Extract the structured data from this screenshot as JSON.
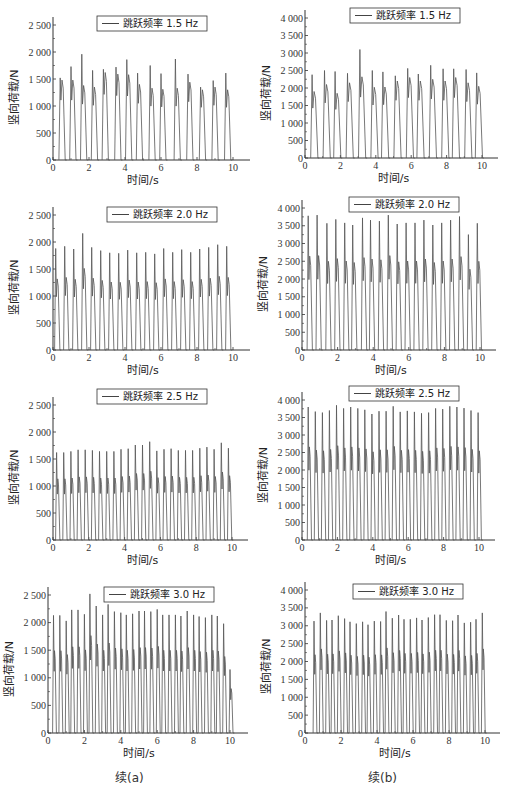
{
  "captions": {
    "left": "续(a)",
    "right": "续(b)"
  },
  "chart_data": [
    {
      "id": "a1",
      "type": "line",
      "legend": "跳跃频率 1.5 Hz",
      "xlabel": "时间/s",
      "ylabel": "竖向荷载/N",
      "xlim": [
        0,
        10
      ],
      "ylim": [
        0,
        2500
      ],
      "xticks": [
        0,
        2,
        4,
        6,
        8,
        10
      ],
      "yticks": [
        0,
        500,
        1000,
        1500,
        2000,
        2500
      ],
      "ytick_labels": [
        "0",
        "500",
        "1 000",
        "1 500",
        "2 000",
        "2 500"
      ],
      "peak_times": [
        0.4,
        1.0,
        1.6,
        2.2,
        2.8,
        3.5,
        4.1,
        4.7,
        5.4,
        6.0,
        6.8,
        7.5,
        8.2,
        8.9,
        9.6
      ],
      "peaks": [
        1520,
        1730,
        1960,
        1660,
        1680,
        1720,
        1860,
        1610,
        1750,
        1600,
        1870,
        1590,
        1350,
        1470,
        1610
      ],
      "shoulders": [
        1480,
        1480,
        1380,
        1350,
        1620,
        1590,
        1580,
        1400,
        1330,
        1310,
        1330,
        1440,
        1300,
        1350,
        1300
      ]
    },
    {
      "id": "b1",
      "type": "line",
      "legend": "跳跃频率 1.5 Hz",
      "xlabel": "时间/s",
      "ylabel": "竖向荷载/N",
      "xlim": [
        0,
        10
      ],
      "ylim": [
        0,
        4000
      ],
      "xticks": [
        0,
        2,
        4,
        6,
        8,
        10
      ],
      "yticks": [
        0,
        500,
        1000,
        1500,
        2000,
        2500,
        3000,
        3500,
        4000
      ],
      "ytick_labels": [
        "0",
        "500",
        "1 000",
        "1 500",
        "2 000",
        "2 500",
        "3 000",
        "3 500",
        "4 000"
      ],
      "peak_times": [
        0.4,
        1.1,
        1.7,
        2.4,
        3.1,
        3.8,
        4.4,
        5.1,
        5.8,
        6.4,
        7.1,
        7.8,
        8.4,
        9.1,
        9.7
      ],
      "peaks": [
        2380,
        2500,
        2470,
        2420,
        3100,
        2500,
        2460,
        2350,
        2560,
        2400,
        2650,
        2550,
        2550,
        2530,
        2430
      ],
      "shoulders": [
        1900,
        2100,
        1850,
        2150,
        2320,
        2020,
        2030,
        2200,
        2300,
        2200,
        2250,
        2200,
        2300,
        2150,
        2050
      ]
    },
    {
      "id": "a2",
      "type": "line",
      "legend": "跳跃频率 2.0 Hz",
      "xlabel": "时间/s",
      "ylabel": "竖向荷载/N",
      "xlim": [
        0,
        10
      ],
      "ylim": [
        0,
        2500
      ],
      "xticks": [
        0,
        2,
        4,
        6,
        8,
        10
      ],
      "yticks": [
        0,
        500,
        1000,
        1500,
        2000,
        2500
      ],
      "ytick_labels": [
        "0",
        "500",
        "1 000",
        "1 500",
        "2 000",
        "2 500"
      ],
      "peak_times": [
        0.15,
        0.65,
        1.15,
        1.65,
        2.15,
        2.65,
        3.15,
        3.65,
        4.15,
        4.65,
        5.15,
        5.65,
        6.15,
        6.65,
        7.15,
        7.65,
        8.15,
        8.65,
        9.15,
        9.65
      ],
      "peaks": [
        1880,
        1920,
        1870,
        2160,
        1900,
        1840,
        1800,
        1790,
        1850,
        1800,
        1810,
        1780,
        1880,
        1810,
        1860,
        1810,
        1870,
        1900,
        1950,
        1920
      ]
    },
    {
      "id": "b2",
      "type": "line",
      "legend": "跳跃频率 2.0 Hz",
      "xlabel": "时间/s",
      "ylabel": "竖向荷载/N",
      "xlim": [
        0,
        10
      ],
      "ylim": [
        0,
        4000
      ],
      "xticks": [
        0,
        2,
        4,
        6,
        8,
        10
      ],
      "yticks": [
        0,
        500,
        1000,
        1500,
        2000,
        2500,
        3000,
        3500,
        4000
      ],
      "ytick_labels": [
        "0",
        "500",
        "1 000",
        "1 500",
        "2 000",
        "2 500",
        "3 000",
        "3 500",
        "4 000"
      ],
      "peak_times": [
        0.35,
        0.85,
        1.4,
        1.9,
        2.4,
        2.85,
        3.4,
        3.85,
        4.35,
        4.85,
        5.35,
        5.85,
        6.35,
        6.85,
        7.35,
        7.85,
        8.35,
        8.85,
        9.35,
        9.85
      ],
      "peaks": [
        3780,
        3800,
        3570,
        3680,
        3580,
        3520,
        3720,
        3660,
        3630,
        3800,
        3550,
        3580,
        3580,
        3660,
        3520,
        3580,
        3660,
        3760,
        3250,
        3570
      ]
    },
    {
      "id": "a3",
      "type": "line",
      "legend": "跳跃频率 2.5 Hz",
      "xlabel": "时间/s",
      "ylabel": "竖向荷载/N",
      "xlim": [
        0,
        10
      ],
      "ylim": [
        0,
        2500
      ],
      "xticks": [
        0,
        2,
        4,
        6,
        8,
        10
      ],
      "yticks": [
        0,
        500,
        1000,
        1500,
        2000,
        2500
      ],
      "ytick_labels": [
        "0",
        "500",
        "1 000",
        "1 500",
        "2 000",
        "2 500"
      ],
      "peak_times": [
        0.2,
        0.6,
        1.0,
        1.4,
        1.8,
        2.2,
        2.6,
        3.0,
        3.4,
        3.8,
        4.2,
        4.6,
        5.0,
        5.4,
        5.8,
        6.2,
        6.6,
        7.0,
        7.4,
        7.8,
        8.2,
        8.6,
        9.0,
        9.4,
        9.8
      ],
      "peaks": [
        1620,
        1620,
        1640,
        1670,
        1670,
        1660,
        1640,
        1640,
        1640,
        1680,
        1690,
        1760,
        1760,
        1820,
        1650,
        1680,
        1690,
        1660,
        1660,
        1660,
        1700,
        1720,
        1680,
        1800,
        1700
      ]
    },
    {
      "id": "b3",
      "type": "line",
      "legend": "跳跃频率 2.5 Hz",
      "xlabel": "时间/s",
      "ylabel": "竖向荷载/N",
      "xlim": [
        0,
        10
      ],
      "ylim": [
        0,
        4000
      ],
      "xticks": [
        0,
        2,
        4,
        6,
        8,
        10
      ],
      "yticks": [
        0,
        500,
        1000,
        1500,
        2000,
        2500,
        3000,
        3500,
        4000
      ],
      "ytick_labels": [
        "0",
        "500",
        "1 000",
        "1 500",
        "2 000",
        "2 500",
        "3 000",
        "3 500",
        "4 000"
      ],
      "peak_times": [
        0.35,
        0.75,
        1.15,
        1.55,
        1.95,
        2.35,
        2.75,
        3.15,
        3.55,
        3.95,
        4.35,
        4.75,
        5.15,
        5.55,
        5.95,
        6.35,
        6.75,
        7.15,
        7.55,
        7.95,
        8.35,
        8.75,
        9.15,
        9.55,
        9.95
      ],
      "peaks": [
        3800,
        3670,
        3640,
        3700,
        3850,
        3760,
        3800,
        3760,
        3720,
        3600,
        3680,
        3680,
        3820,
        3660,
        3690,
        3660,
        3620,
        3640,
        3760,
        3740,
        3820,
        3800,
        3770,
        3700,
        3640
      ]
    },
    {
      "id": "a4",
      "type": "line",
      "legend": "跳跃频率 3.0 Hz",
      "xlabel": "时间/s",
      "ylabel": "竖向荷载/N",
      "xlim": [
        0,
        10
      ],
      "ylim": [
        0,
        2500
      ],
      "xticks": [
        0,
        2,
        4,
        6,
        8,
        10
      ],
      "yticks": [
        0,
        500,
        1000,
        1500,
        2000,
        2500
      ],
      "ytick_labels": [
        "0",
        "500",
        "1 000",
        "1 500",
        "2 000",
        "2 500"
      ],
      "peak_times": [
        0.3,
        0.65,
        1.0,
        1.3,
        1.65,
        2.0,
        2.3,
        2.65,
        3.0,
        3.3,
        3.65,
        4.0,
        4.3,
        4.65,
        5.0,
        5.3,
        5.65,
        6.0,
        6.3,
        6.65,
        7.0,
        7.3,
        7.65,
        8.0,
        8.3,
        8.65,
        9.0,
        9.3,
        9.65,
        10.0
      ],
      "peaks": [
        2130,
        2130,
        2030,
        2230,
        2230,
        2150,
        2520,
        2300,
        2140,
        2330,
        2200,
        2180,
        2140,
        2160,
        2210,
        2210,
        2200,
        2240,
        2140,
        2140,
        2140,
        2120,
        2210,
        2140,
        2110,
        2090,
        2140,
        2120,
        1980,
        1150
      ]
    },
    {
      "id": "b4",
      "type": "line",
      "legend": "跳跃频率 3.0 Hz",
      "xlabel": "时间/s",
      "ylabel": "竖向荷载/N",
      "xlim": [
        0,
        10
      ],
      "ylim": [
        0,
        4000
      ],
      "xticks": [
        0,
        2,
        4,
        6,
        8,
        10
      ],
      "yticks": [
        0,
        500,
        1000,
        1500,
        2000,
        2500,
        3000,
        3500,
        4000
      ],
      "ytick_labels": [
        "0",
        "500",
        "1 000",
        "1 500",
        "2 000",
        "2 500",
        "3 000",
        "3 500",
        "4 000"
      ],
      "peak_times": [
        0.5,
        0.85,
        1.2,
        1.5,
        1.85,
        2.2,
        2.5,
        2.85,
        3.2,
        3.5,
        3.85,
        4.2,
        4.5,
        4.85,
        5.2,
        5.5,
        5.85,
        6.2,
        6.5,
        6.85,
        7.2,
        7.5,
        7.85,
        8.2,
        8.5,
        8.85,
        9.2,
        9.5,
        9.85
      ],
      "peaks": [
        3130,
        3360,
        3150,
        3160,
        3280,
        3200,
        3110,
        3060,
        3110,
        3030,
        3130,
        3120,
        3400,
        3210,
        3300,
        3180,
        3180,
        3220,
        3160,
        3230,
        3310,
        3310,
        3150,
        3140,
        3300,
        3080,
        3100,
        3180,
        3360
      ]
    }
  ]
}
